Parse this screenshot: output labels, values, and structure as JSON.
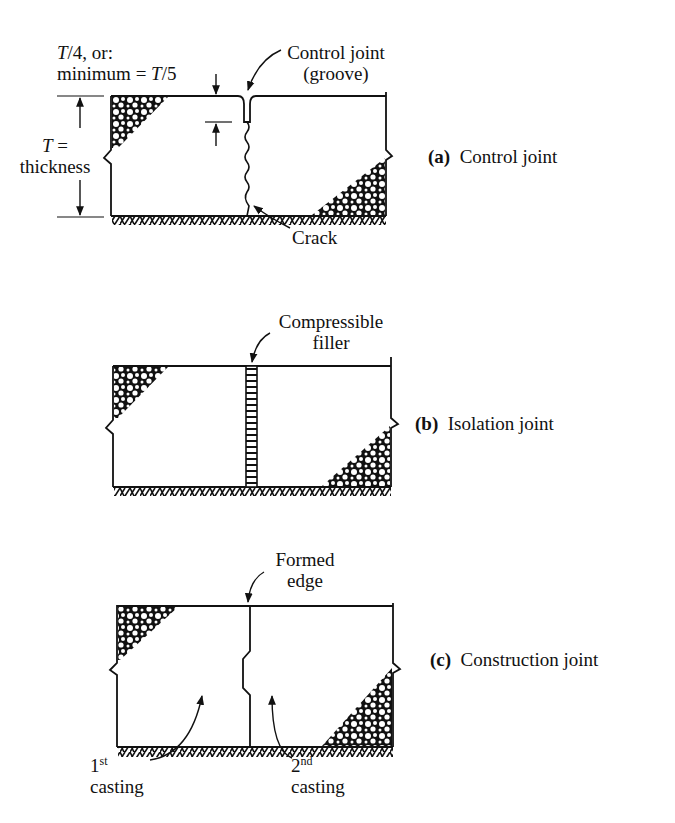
{
  "panels": [
    {
      "id": "a",
      "caption_letter": "(a)",
      "caption_text": "Control joint",
      "labels": {
        "depth_line1_var": "T",
        "depth_line1_rest": "/4, or:",
        "depth_line2_pre": "minimum = ",
        "depth_line2_var": "T",
        "depth_line2_rest": "/5",
        "groove_line1": "Control joint",
        "groove_line2": "(groove)",
        "thickness_var": "T",
        "thickness_eq": " =",
        "thickness_word": "thickness",
        "crack": "Crack"
      }
    },
    {
      "id": "b",
      "caption_letter": "(b)",
      "caption_text": "Isolation joint",
      "labels": {
        "filler_line1": "Compressible",
        "filler_line2": "filler"
      }
    },
    {
      "id": "c",
      "caption_letter": "(c)",
      "caption_text": "Construction joint",
      "labels": {
        "edge_line1": "Formed",
        "edge_line2": "edge",
        "first_num": "1",
        "first_sup": "st",
        "first_word": "casting",
        "second_num": "2",
        "second_sup": "nd",
        "second_word": "casting"
      }
    }
  ]
}
